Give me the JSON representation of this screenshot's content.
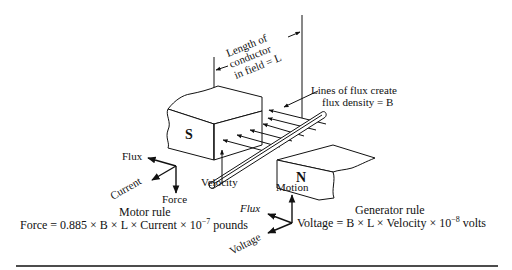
{
  "diagram": {
    "labels": {
      "length_line1": "Length of",
      "length_line2": "conductor",
      "length_line3": "in field = L",
      "flux_line1": "Lines of flux create",
      "flux_line2": "flux density = B",
      "south_pole": "S",
      "north_pole": "N",
      "velocity": "Velocity",
      "motion": "Motion"
    },
    "motor_rule": {
      "axis_flux": "Flux",
      "axis_current": "Current",
      "axis_force": "Force",
      "title": "Motor rule",
      "formula_prefix": "Force = 0.885 × B × L × Current × 10",
      "formula_exp": "−7",
      "formula_suffix": " pounds"
    },
    "generator_rule": {
      "axis_flux": "Flux",
      "axis_voltage": "Voltage",
      "axis_motion": "Motion",
      "title": "Generator rule",
      "formula_prefix": "Voltage = B × L × Velocity × 10",
      "formula_exp": "−8",
      "formula_suffix": " volts"
    }
  }
}
